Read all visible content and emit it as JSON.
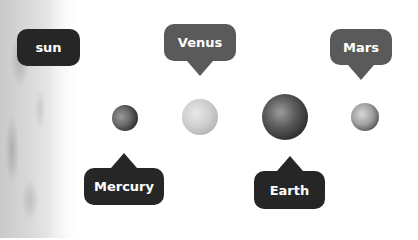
{
  "labels": {
    "sun": "sun",
    "venus": "Venus",
    "mars": "Mars",
    "mercury": "Mercury",
    "earth": "Earth"
  },
  "colors": {
    "dark_bubble": "#262626",
    "mid_bubble": "#5a5a5a",
    "text": "#ffffff",
    "background": "#ffffff"
  }
}
